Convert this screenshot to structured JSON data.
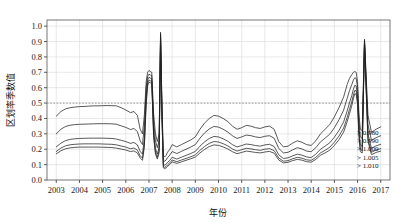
{
  "chart_data": {
    "type": "line",
    "title": "",
    "xlabel": "年份",
    "ylabel": "区划率季数值",
    "xlim": [
      2002.6,
      2017.4
    ],
    "ylim": [
      0.0,
      1.04
    ],
    "grid": true,
    "legend_position": "right-inside-bottom",
    "reference_lines": [
      {
        "axis": "y",
        "value": 0.5,
        "style": "dotted",
        "color": "#888888"
      }
    ],
    "ytick_labels": [
      "0.0",
      "0.1",
      "0.2",
      "0.3",
      "0.4",
      "0.5",
      "0.6",
      "0.7",
      "0.8",
      "0.9",
      "1.0"
    ],
    "ytick_values": [
      0.0,
      0.1,
      0.2,
      0.3,
      0.4,
      0.5,
      0.6,
      0.7,
      0.8,
      0.9,
      1.0
    ],
    "xtick_labels": [
      "2003",
      "2004",
      "2005",
      "2006",
      "2007",
      "2008",
      "2009",
      "2010",
      "2011",
      "2012",
      "2013",
      "2014",
      "2015",
      "2016",
      "2017"
    ],
    "xtick_values": [
      2003,
      2004,
      2005,
      2006,
      2007,
      2008,
      2009,
      2010,
      2011,
      2012,
      2013,
      2014,
      2015,
      2016,
      2017
    ],
    "legend_entries": [
      "> 0.980",
      "> 0.990",
      "> 1.000",
      "> 1.005",
      "> 1.010"
    ],
    "line_color": "#222222",
    "series": [
      {
        "name": "> 0.980",
        "x": [
          2003.0,
          2003.2,
          2003.4,
          2003.6,
          2003.8,
          2004.0,
          2004.2,
          2004.4,
          2004.6,
          2004.8,
          2005.0,
          2005.2,
          2005.4,
          2005.6,
          2005.8,
          2006.0,
          2006.2,
          2006.35,
          2006.5,
          2006.62,
          2006.72,
          2006.8,
          2006.88,
          2006.94,
          2007.0,
          2007.06,
          2007.12,
          2007.2,
          2007.28,
          2007.36,
          2007.44,
          2007.5,
          2007.56,
          2007.62,
          2007.68,
          2007.74,
          2007.8,
          2007.9,
          2008.0,
          2008.2,
          2008.4,
          2008.6,
          2008.8,
          2009.0,
          2009.2,
          2009.4,
          2009.6,
          2009.8,
          2010.0,
          2010.2,
          2010.4,
          2010.6,
          2010.8,
          2011.0,
          2011.2,
          2011.4,
          2011.6,
          2011.8,
          2012.0,
          2012.2,
          2012.4,
          2012.6,
          2012.8,
          2013.0,
          2013.2,
          2013.4,
          2013.6,
          2013.8,
          2014.0,
          2014.2,
          2014.4,
          2014.6,
          2014.8,
          2015.0,
          2015.2,
          2015.4,
          2015.55,
          2015.65,
          2015.75,
          2015.82,
          2015.88,
          2015.94,
          2016.0,
          2016.06,
          2016.12,
          2016.2,
          2016.3,
          2016.45,
          2016.6,
          2016.8,
          2017.0
        ],
        "y": [
          0.415,
          0.445,
          0.462,
          0.47,
          0.474,
          0.477,
          0.478,
          0.48,
          0.482,
          0.482,
          0.483,
          0.484,
          0.483,
          0.482,
          0.47,
          0.455,
          0.438,
          0.445,
          0.42,
          0.33,
          0.3,
          0.42,
          0.64,
          0.7,
          0.712,
          0.705,
          0.7,
          0.43,
          0.3,
          0.25,
          0.3,
          0.96,
          0.5,
          0.16,
          0.15,
          0.16,
          0.18,
          0.2,
          0.23,
          0.215,
          0.23,
          0.245,
          0.26,
          0.28,
          0.33,
          0.37,
          0.4,
          0.42,
          0.415,
          0.4,
          0.38,
          0.35,
          0.33,
          0.34,
          0.355,
          0.35,
          0.34,
          0.335,
          0.345,
          0.35,
          0.33,
          0.25,
          0.215,
          0.22,
          0.24,
          0.255,
          0.245,
          0.23,
          0.225,
          0.255,
          0.3,
          0.33,
          0.36,
          0.41,
          0.47,
          0.54,
          0.62,
          0.66,
          0.685,
          0.7,
          0.705,
          0.7,
          0.64,
          0.43,
          0.33,
          0.32,
          0.915,
          0.42,
          0.31,
          0.33,
          0.345
        ]
      },
      {
        "name": "> 0.990",
        "x": [
          2003.0,
          2003.2,
          2003.4,
          2003.6,
          2003.8,
          2004.0,
          2004.2,
          2004.4,
          2004.6,
          2004.8,
          2005.0,
          2005.2,
          2005.4,
          2005.6,
          2005.8,
          2006.0,
          2006.2,
          2006.35,
          2006.5,
          2006.62,
          2006.72,
          2006.8,
          2006.88,
          2006.94,
          2007.0,
          2007.06,
          2007.12,
          2007.2,
          2007.28,
          2007.36,
          2007.44,
          2007.5,
          2007.56,
          2007.62,
          2007.68,
          2007.74,
          2007.8,
          2007.9,
          2008.0,
          2008.2,
          2008.4,
          2008.6,
          2008.8,
          2009.0,
          2009.2,
          2009.4,
          2009.6,
          2009.8,
          2010.0,
          2010.2,
          2010.4,
          2010.6,
          2010.8,
          2011.0,
          2011.2,
          2011.4,
          2011.6,
          2011.8,
          2012.0,
          2012.2,
          2012.4,
          2012.6,
          2012.8,
          2013.0,
          2013.2,
          2013.4,
          2013.6,
          2013.8,
          2014.0,
          2014.2,
          2014.4,
          2014.6,
          2014.8,
          2015.0,
          2015.2,
          2015.4,
          2015.55,
          2015.65,
          2015.75,
          2015.82,
          2015.88,
          2015.94,
          2016.0,
          2016.06,
          2016.12,
          2016.2,
          2016.3,
          2016.45,
          2016.6,
          2016.8,
          2017.0
        ],
        "y": [
          0.3,
          0.33,
          0.348,
          0.356,
          0.36,
          0.362,
          0.363,
          0.364,
          0.365,
          0.366,
          0.366,
          0.366,
          0.365,
          0.362,
          0.352,
          0.342,
          0.328,
          0.335,
          0.315,
          0.255,
          0.23,
          0.35,
          0.6,
          0.672,
          0.688,
          0.682,
          0.678,
          0.38,
          0.255,
          0.21,
          0.26,
          0.945,
          0.47,
          0.13,
          0.122,
          0.13,
          0.145,
          0.162,
          0.185,
          0.172,
          0.186,
          0.2,
          0.214,
          0.23,
          0.272,
          0.306,
          0.332,
          0.348,
          0.344,
          0.33,
          0.312,
          0.288,
          0.27,
          0.28,
          0.292,
          0.288,
          0.28,
          0.276,
          0.284,
          0.288,
          0.272,
          0.205,
          0.176,
          0.18,
          0.196,
          0.21,
          0.202,
          0.188,
          0.184,
          0.21,
          0.248,
          0.272,
          0.298,
          0.34,
          0.392,
          0.455,
          0.53,
          0.58,
          0.62,
          0.65,
          0.665,
          0.66,
          0.6,
          0.385,
          0.28,
          0.27,
          0.905,
          0.36,
          0.258,
          0.275,
          0.288
        ]
      },
      {
        "name": "> 1.000",
        "x": [
          2003.0,
          2003.2,
          2003.4,
          2003.6,
          2003.8,
          2004.0,
          2004.2,
          2004.4,
          2004.6,
          2004.8,
          2005.0,
          2005.2,
          2005.4,
          2005.6,
          2005.8,
          2006.0,
          2006.2,
          2006.35,
          2006.5,
          2006.62,
          2006.72,
          2006.8,
          2006.88,
          2006.94,
          2007.0,
          2007.06,
          2007.12,
          2007.2,
          2007.28,
          2007.36,
          2007.44,
          2007.5,
          2007.56,
          2007.62,
          2007.68,
          2007.74,
          2007.8,
          2007.9,
          2008.0,
          2008.2,
          2008.4,
          2008.6,
          2008.8,
          2009.0,
          2009.2,
          2009.4,
          2009.6,
          2009.8,
          2010.0,
          2010.2,
          2010.4,
          2010.6,
          2010.8,
          2011.0,
          2011.2,
          2011.4,
          2011.6,
          2011.8,
          2012.0,
          2012.2,
          2012.4,
          2012.6,
          2012.8,
          2013.0,
          2013.2,
          2013.4,
          2013.6,
          2013.8,
          2014.0,
          2014.2,
          2014.4,
          2014.6,
          2014.8,
          2015.0,
          2015.2,
          2015.4,
          2015.55,
          2015.65,
          2015.75,
          2015.82,
          2015.88,
          2015.94,
          2016.0,
          2016.06,
          2016.12,
          2016.2,
          2016.3,
          2016.45,
          2016.6,
          2016.8,
          2017.0
        ],
        "y": [
          0.215,
          0.24,
          0.256,
          0.264,
          0.268,
          0.27,
          0.271,
          0.272,
          0.272,
          0.272,
          0.272,
          0.271,
          0.27,
          0.266,
          0.258,
          0.25,
          0.238,
          0.244,
          0.228,
          0.186,
          0.168,
          0.27,
          0.545,
          0.65,
          0.668,
          0.662,
          0.658,
          0.325,
          0.205,
          0.168,
          0.215,
          0.93,
          0.44,
          0.102,
          0.096,
          0.102,
          0.114,
          0.128,
          0.148,
          0.136,
          0.148,
          0.16,
          0.172,
          0.186,
          0.22,
          0.248,
          0.27,
          0.283,
          0.28,
          0.268,
          0.252,
          0.23,
          0.215,
          0.224,
          0.234,
          0.23,
          0.224,
          0.22,
          0.228,
          0.232,
          0.218,
          0.164,
          0.14,
          0.144,
          0.157,
          0.168,
          0.162,
          0.15,
          0.146,
          0.168,
          0.2,
          0.22,
          0.242,
          0.278,
          0.322,
          0.378,
          0.448,
          0.5,
          0.548,
          0.59,
          0.615,
          0.612,
          0.545,
          0.33,
          0.228,
          0.218,
          0.898,
          0.3,
          0.206,
          0.222,
          0.232
        ]
      },
      {
        "name": "> 1.005",
        "x": [
          2003.0,
          2003.2,
          2003.4,
          2003.6,
          2003.8,
          2004.0,
          2004.2,
          2004.4,
          2004.6,
          2004.8,
          2005.0,
          2005.2,
          2005.4,
          2005.6,
          2005.8,
          2006.0,
          2006.2,
          2006.35,
          2006.5,
          2006.62,
          2006.72,
          2006.8,
          2006.88,
          2006.94,
          2007.0,
          2007.06,
          2007.12,
          2007.2,
          2007.28,
          2007.36,
          2007.44,
          2007.5,
          2007.56,
          2007.62,
          2007.68,
          2007.74,
          2007.8,
          2007.9,
          2008.0,
          2008.2,
          2008.4,
          2008.6,
          2008.8,
          2009.0,
          2009.2,
          2009.4,
          2009.6,
          2009.8,
          2010.0,
          2010.2,
          2010.4,
          2010.6,
          2010.8,
          2011.0,
          2011.2,
          2011.4,
          2011.6,
          2011.8,
          2012.0,
          2012.2,
          2012.4,
          2012.6,
          2012.8,
          2013.0,
          2013.2,
          2013.4,
          2013.6,
          2013.8,
          2014.0,
          2014.2,
          2014.4,
          2014.6,
          2014.8,
          2015.0,
          2015.2,
          2015.4,
          2015.55,
          2015.65,
          2015.75,
          2015.82,
          2015.88,
          2015.94,
          2016.0,
          2016.06,
          2016.12,
          2016.2,
          2016.3,
          2016.45,
          2016.6,
          2016.8,
          2017.0
        ],
        "y": [
          0.185,
          0.208,
          0.222,
          0.229,
          0.232,
          0.234,
          0.235,
          0.235,
          0.235,
          0.235,
          0.234,
          0.233,
          0.232,
          0.228,
          0.221,
          0.214,
          0.203,
          0.208,
          0.194,
          0.158,
          0.142,
          0.232,
          0.512,
          0.628,
          0.65,
          0.645,
          0.641,
          0.296,
          0.182,
          0.148,
          0.192,
          0.922,
          0.42,
          0.088,
          0.082,
          0.088,
          0.098,
          0.112,
          0.13,
          0.119,
          0.13,
          0.14,
          0.151,
          0.163,
          0.193,
          0.218,
          0.238,
          0.25,
          0.247,
          0.236,
          0.222,
          0.202,
          0.188,
          0.197,
          0.206,
          0.202,
          0.197,
          0.193,
          0.2,
          0.204,
          0.191,
          0.143,
          0.122,
          0.126,
          0.138,
          0.147,
          0.142,
          0.131,
          0.128,
          0.147,
          0.176,
          0.193,
          0.213,
          0.246,
          0.286,
          0.338,
          0.405,
          0.458,
          0.508,
          0.552,
          0.582,
          0.58,
          0.512,
          0.3,
          0.2,
          0.191,
          0.893,
          0.268,
          0.18,
          0.195,
          0.204
        ]
      },
      {
        "name": "> 1.010",
        "x": [
          2003.0,
          2003.2,
          2003.4,
          2003.6,
          2003.8,
          2004.0,
          2004.2,
          2004.4,
          2004.6,
          2004.8,
          2005.0,
          2005.2,
          2005.4,
          2005.6,
          2005.8,
          2006.0,
          2006.2,
          2006.35,
          2006.5,
          2006.62,
          2006.72,
          2006.8,
          2006.88,
          2006.94,
          2007.0,
          2007.06,
          2007.12,
          2007.2,
          2007.28,
          2007.36,
          2007.44,
          2007.5,
          2007.56,
          2007.62,
          2007.68,
          2007.74,
          2007.8,
          2007.9,
          2008.0,
          2008.2,
          2008.4,
          2008.6,
          2008.8,
          2009.0,
          2009.2,
          2009.4,
          2009.6,
          2009.8,
          2010.0,
          2010.2,
          2010.4,
          2010.6,
          2010.8,
          2011.0,
          2011.2,
          2011.4,
          2011.6,
          2011.8,
          2012.0,
          2012.2,
          2012.4,
          2012.6,
          2012.8,
          2013.0,
          2013.2,
          2013.4,
          2013.6,
          2013.8,
          2014.0,
          2014.2,
          2014.4,
          2014.6,
          2014.8,
          2015.0,
          2015.2,
          2015.4,
          2015.55,
          2015.65,
          2015.75,
          2015.82,
          2015.88,
          2015.94,
          2016.0,
          2016.06,
          2016.12,
          2016.2,
          2016.3,
          2016.45,
          2016.6,
          2016.8,
          2017.0
        ],
        "y": [
          0.17,
          0.19,
          0.203,
          0.209,
          0.212,
          0.214,
          0.214,
          0.214,
          0.214,
          0.214,
          0.213,
          0.212,
          0.211,
          0.207,
          0.201,
          0.195,
          0.185,
          0.189,
          0.176,
          0.143,
          0.128,
          0.212,
          0.49,
          0.612,
          0.636,
          0.632,
          0.628,
          0.278,
          0.168,
          0.136,
          0.178,
          0.915,
          0.408,
          0.079,
          0.073,
          0.079,
          0.088,
          0.101,
          0.118,
          0.108,
          0.118,
          0.128,
          0.138,
          0.149,
          0.176,
          0.199,
          0.217,
          0.228,
          0.225,
          0.215,
          0.202,
          0.184,
          0.171,
          0.179,
          0.188,
          0.184,
          0.179,
          0.176,
          0.182,
          0.186,
          0.174,
          0.13,
          0.111,
          0.115,
          0.126,
          0.134,
          0.129,
          0.119,
          0.116,
          0.134,
          0.161,
          0.176,
          0.194,
          0.225,
          0.262,
          0.312,
          0.378,
          0.43,
          0.482,
          0.528,
          0.56,
          0.558,
          0.49,
          0.282,
          0.184,
          0.176,
          0.89,
          0.25,
          0.165,
          0.179,
          0.188
        ]
      }
    ]
  }
}
